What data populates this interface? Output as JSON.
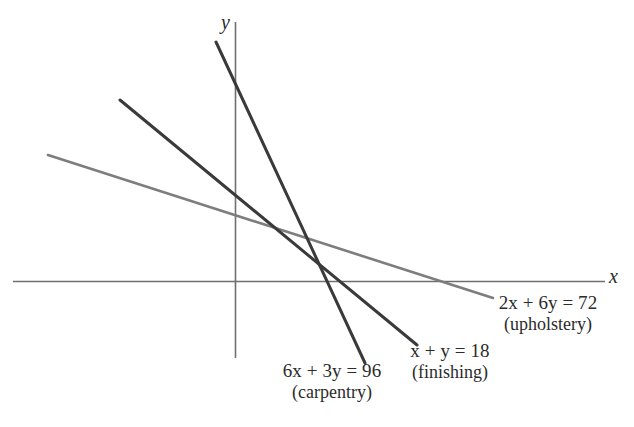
{
  "figure": {
    "axes": {
      "x_label": "x",
      "y_label": "y",
      "x_axis_color": "#6f6f6f",
      "y_axis_color": "#6f6f6f"
    },
    "annotations": [
      {
        "id": "upholstery",
        "equation": "2x + 6y = 72",
        "eq_coef_a": "2",
        "eq_var_x": "x",
        "eq_plus": "+",
        "eq_coef_b": "6",
        "eq_var_y": "y",
        "eq_equals": "=",
        "eq_rhs": "72",
        "name": "(upholstery)",
        "color": "#7d7d7d"
      },
      {
        "id": "finishing",
        "equation": "x + y = 18",
        "eq_coef_a": "",
        "eq_var_x": "x",
        "eq_plus": "+",
        "eq_coef_b": "",
        "eq_var_y": "y",
        "eq_equals": "=",
        "eq_rhs": "18",
        "name": "(finishing)",
        "color": "#3a3a3a"
      },
      {
        "id": "carpentry",
        "equation": "6x + 3y = 96",
        "eq_coef_a": "6",
        "eq_var_x": "x",
        "eq_plus": "+",
        "eq_coef_b": "3",
        "eq_var_y": "y",
        "eq_equals": "=",
        "eq_rhs": "96",
        "name": "(carpentry)",
        "color": "#3a3a3a"
      }
    ]
  },
  "chart_data": {
    "type": "line",
    "title": "",
    "xlabel": "x",
    "ylabel": "y",
    "grid": false,
    "legend": "inline-annotations",
    "origin_px": {
      "x": 235,
      "y": 281
    },
    "px_per_unit": {
      "x": 14.8,
      "y": 14.8
    },
    "axis_extent_px": {
      "x_axis": {
        "x1": 13,
        "y1": 281,
        "x2": 605,
        "y2": 281
      },
      "y_axis": {
        "x1": 235,
        "y1": 22,
        "x2": 235,
        "y2": 358
      }
    },
    "series": [
      {
        "name": "2x + 6y = 72",
        "label": "upholstery",
        "color": "#7d7d7d",
        "stroke_width": 2.6,
        "equation": {
          "a": 2,
          "b": 6,
          "c": 72
        },
        "slope": -0.3333,
        "y_intercept": 12,
        "x_intercept": 36,
        "endpoints_px": [
          {
            "x": 48,
            "y": 155
          },
          {
            "x": 493,
            "y": 298
          }
        ],
        "endpoints_data": [
          {
            "x": -12.6,
            "y": 14.2
          },
          {
            "x": 17.4,
            "y": -1.15
          }
        ]
      },
      {
        "name": "x + y = 18",
        "label": "finishing",
        "color": "#3a3a3a",
        "stroke_width": 3.0,
        "equation": {
          "a": 1,
          "b": 1,
          "c": 18
        },
        "slope": -1,
        "y_intercept": 18,
        "x_intercept": 18,
        "endpoints_px": [
          {
            "x": 120,
            "y": 100
          },
          {
            "x": 417,
            "y": 345
          }
        ],
        "endpoints_data": [
          {
            "x": -7.8,
            "y": 12.2
          },
          {
            "x": 12.3,
            "y": -4.3
          }
        ]
      },
      {
        "name": "6x + 3y = 96",
        "label": "carpentry",
        "color": "#3a3a3a",
        "stroke_width": 3.0,
        "equation": {
          "a": 6,
          "b": 3,
          "c": 96
        },
        "slope": -2,
        "y_intercept": 32,
        "x_intercept": 16,
        "endpoints_px": [
          {
            "x": 216,
            "y": 42
          },
          {
            "x": 365,
            "y": 363
          }
        ],
        "endpoints_data": [
          {
            "x": -1.3,
            "y": 16.1
          },
          {
            "x": 8.8,
            "y": -5.5
          }
        ]
      }
    ],
    "intersections": [
      {
        "of": [
          "6x + 3y = 96",
          "x + y = 18"
        ],
        "x": 14,
        "y": 4,
        "px": {
          "x": 326,
          "y": 272
        }
      },
      {
        "of": [
          "x + y = 18",
          "2x + 6y = 72"
        ],
        "x": 9,
        "y": 9,
        "px": {
          "x": 311,
          "y": 253
        }
      },
      {
        "of": [
          "6x + 3y = 96",
          "2x + 6y = 72"
        ],
        "x": 12,
        "y": 8,
        "px": {
          "x": 318,
          "y": 259
        }
      }
    ]
  }
}
